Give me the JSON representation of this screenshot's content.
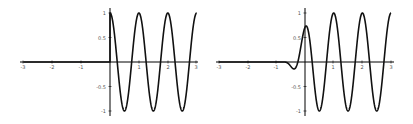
{
  "chart_data": [
    {
      "type": "line",
      "title": "",
      "xlabel": "",
      "ylabel": "",
      "xlim": [
        -3,
        3
      ],
      "ylim": [
        -1,
        1
      ],
      "grid": false,
      "legend": null,
      "x_ticks": [
        "-3",
        "-2",
        "-1",
        "1",
        "2",
        "3"
      ],
      "y_ticks": [
        "1",
        "0.5",
        "-0.5",
        "-1"
      ],
      "series": [
        {
          "name": "f(x) = 0 for x<0, cos(2πx) for x≥0",
          "x": [
            -3,
            -2,
            -1,
            0,
            0.25,
            0.5,
            0.75,
            1,
            1.25,
            1.5,
            1.75,
            2,
            2.25,
            2.5,
            2.75,
            3
          ],
          "y": [
            0,
            0,
            0,
            1,
            0,
            -1,
            0,
            1,
            0,
            -1,
            0,
            1,
            0,
            -1,
            0,
            1
          ]
        }
      ]
    },
    {
      "type": "line",
      "title": "",
      "xlabel": "",
      "ylabel": "",
      "xlim": [
        -3,
        3
      ],
      "ylim": [
        -1,
        1
      ],
      "grid": false,
      "legend": null,
      "x_ticks": [
        "-3",
        "-2",
        "-1",
        "1",
        "2",
        "3"
      ],
      "y_ticks": [
        "1",
        "0.5",
        "-0.5",
        "-1"
      ],
      "series": [
        {
          "name": "smoothed cos(2πx)",
          "x": [
            -3,
            -2,
            -1,
            -0.8,
            -0.4,
            -0.2,
            0,
            0.25,
            0.5,
            0.75,
            1,
            1.25,
            1.5,
            1.75,
            2,
            2.25,
            2.5,
            2.75,
            3
          ],
          "y": [
            0,
            0,
            0,
            0,
            -0.27,
            0.2,
            0.72,
            0.1,
            -1,
            0,
            1,
            0,
            -1,
            0,
            1,
            0,
            -1,
            0,
            1
          ]
        }
      ]
    }
  ],
  "plots": [
    {
      "x_tick_labels": [
        "-3",
        "-2",
        "-1",
        "1",
        "2",
        "3"
      ],
      "y_tick_labels": [
        "1",
        "0.5",
        "-0.5",
        "-1"
      ]
    },
    {
      "x_tick_labels": [
        "-3",
        "-2",
        "-1",
        "1",
        "2",
        "3"
      ],
      "y_tick_labels": [
        "1",
        "0.5",
        "-0.5",
        "-1"
      ]
    }
  ]
}
